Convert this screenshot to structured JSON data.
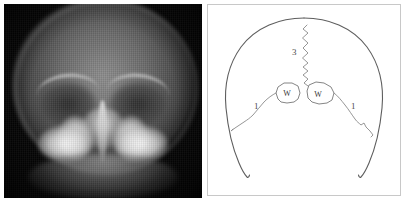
{
  "figure": {
    "panels": [
      {
        "id": "radiograph",
        "kind": "xray-image",
        "view": "AP skull radiograph",
        "background_color": "#050505"
      },
      {
        "id": "line-diagram",
        "kind": "schematic",
        "background_color": "#ffffff",
        "border_color": "#c8c8c8"
      }
    ]
  },
  "diagram": {
    "outline_color": "#5e5e5e",
    "suture_color": "#8a8a8a",
    "labels": [
      {
        "id": "suture-left",
        "text": "1",
        "x": 46,
        "y": 104
      },
      {
        "id": "suture-right",
        "text": "1",
        "x": 143,
        "y": 104
      },
      {
        "id": "suture-sagittal",
        "text": "3",
        "x": 84,
        "y": 50
      }
    ],
    "wormian_bones": [
      {
        "id": "wormian-left",
        "text": "W",
        "cx": 79,
        "cy": 88
      },
      {
        "id": "wormian-right",
        "text": "W",
        "cx": 110,
        "cy": 89
      }
    ]
  }
}
